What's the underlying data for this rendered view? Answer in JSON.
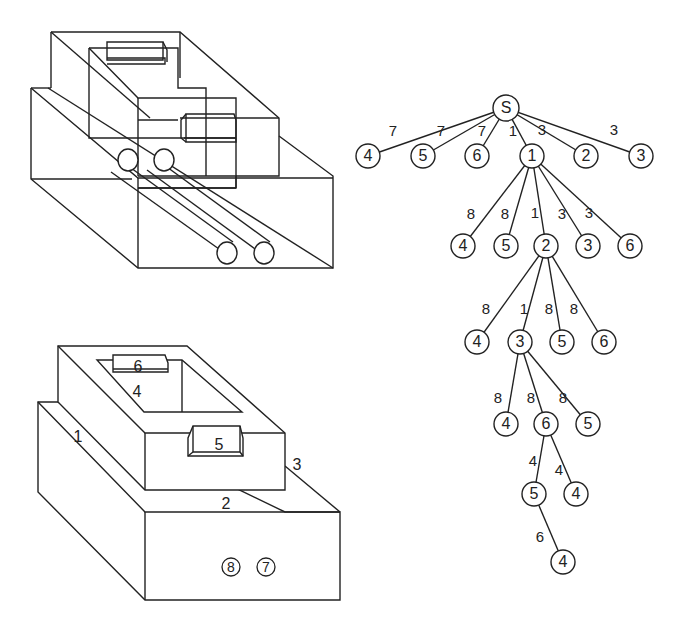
{
  "figure": {
    "top_drawing": {
      "description": "3D wireframe of stepped block assembly with two cylindrical pipes"
    },
    "bottom_drawing": {
      "labels": [
        {
          "text": "6",
          "x": 138,
          "y": 368
        },
        {
          "text": "4",
          "x": 137,
          "y": 393
        },
        {
          "text": "1",
          "x": 78,
          "y": 438
        },
        {
          "text": "5",
          "x": 219,
          "y": 446
        },
        {
          "text": "3",
          "x": 297,
          "y": 466
        },
        {
          "text": "2",
          "x": 226,
          "y": 505
        }
      ],
      "circled_labels": [
        {
          "text": "8",
          "x": 231,
          "y": 567
        },
        {
          "text": "7",
          "x": 266,
          "y": 567
        }
      ]
    },
    "tree": {
      "nodes": [
        {
          "id": "S",
          "label": "S",
          "x": 506,
          "y": 108
        },
        {
          "id": "a4",
          "label": "4",
          "x": 368,
          "y": 156
        },
        {
          "id": "a5",
          "label": "5",
          "x": 423,
          "y": 156
        },
        {
          "id": "a6",
          "label": "6",
          "x": 477,
          "y": 156
        },
        {
          "id": "a1",
          "label": "1",
          "x": 532,
          "y": 156
        },
        {
          "id": "a2",
          "label": "2",
          "x": 586,
          "y": 156
        },
        {
          "id": "a3",
          "label": "3",
          "x": 641,
          "y": 156
        },
        {
          "id": "b4",
          "label": "4",
          "x": 463,
          "y": 246
        },
        {
          "id": "b5",
          "label": "5",
          "x": 506,
          "y": 246
        },
        {
          "id": "b2",
          "label": "2",
          "x": 546,
          "y": 246
        },
        {
          "id": "b3",
          "label": "3",
          "x": 588,
          "y": 246
        },
        {
          "id": "b6",
          "label": "6",
          "x": 630,
          "y": 246
        },
        {
          "id": "c4",
          "label": "4",
          "x": 477,
          "y": 342
        },
        {
          "id": "c3",
          "label": "3",
          "x": 520,
          "y": 342
        },
        {
          "id": "c5",
          "label": "5",
          "x": 562,
          "y": 342
        },
        {
          "id": "c6",
          "label": "6",
          "x": 604,
          "y": 342
        },
        {
          "id": "d4",
          "label": "4",
          "x": 506,
          "y": 424
        },
        {
          "id": "d6",
          "label": "6",
          "x": 546,
          "y": 424
        },
        {
          "id": "d5",
          "label": "5",
          "x": 588,
          "y": 424
        },
        {
          "id": "e5",
          "label": "5",
          "x": 534,
          "y": 494
        },
        {
          "id": "e4",
          "label": "4",
          "x": 576,
          "y": 494
        },
        {
          "id": "f4",
          "label": "4",
          "x": 563,
          "y": 562
        }
      ],
      "edges": [
        {
          "from": "S",
          "to": "a4",
          "weight": "7",
          "lx": 393,
          "ly": 132
        },
        {
          "from": "S",
          "to": "a5",
          "weight": "7",
          "lx": 441,
          "ly": 132
        },
        {
          "from": "S",
          "to": "a6",
          "weight": "7",
          "lx": 482,
          "ly": 132
        },
        {
          "from": "S",
          "to": "a1",
          "weight": "1",
          "lx": 513,
          "ly": 132
        },
        {
          "from": "S",
          "to": "a2",
          "weight": "3",
          "lx": 542,
          "ly": 131
        },
        {
          "from": "S",
          "to": "a3",
          "weight": "3",
          "lx": 614,
          "ly": 131
        },
        {
          "from": "a1",
          "to": "b4",
          "weight": "8",
          "lx": 471,
          "ly": 215
        },
        {
          "from": "a1",
          "to": "b5",
          "weight": "8",
          "lx": 505,
          "ly": 215
        },
        {
          "from": "a1",
          "to": "b2",
          "weight": "1",
          "lx": 535,
          "ly": 214
        },
        {
          "from": "a1",
          "to": "b3",
          "weight": "3",
          "lx": 562,
          "ly": 215
        },
        {
          "from": "a1",
          "to": "b6",
          "weight": "3",
          "lx": 589,
          "ly": 214
        },
        {
          "from": "b2",
          "to": "c4",
          "weight": "8",
          "lx": 486,
          "ly": 310
        },
        {
          "from": "b2",
          "to": "c3",
          "weight": "1",
          "lx": 524,
          "ly": 310
        },
        {
          "from": "b2",
          "to": "c5",
          "weight": "8",
          "lx": 549,
          "ly": 310
        },
        {
          "from": "b2",
          "to": "c6",
          "weight": "8",
          "lx": 574,
          "ly": 310
        },
        {
          "from": "c3",
          "to": "d4",
          "weight": "8",
          "lx": 498,
          "ly": 399
        },
        {
          "from": "c3",
          "to": "d6",
          "weight": "8",
          "lx": 531,
          "ly": 399
        },
        {
          "from": "c3",
          "to": "d5",
          "weight": "8",
          "lx": 563,
          "ly": 399
        },
        {
          "from": "d6",
          "to": "e5",
          "weight": "4",
          "lx": 533,
          "ly": 462
        },
        {
          "from": "d6",
          "to": "e4",
          "weight": "4",
          "lx": 559,
          "ly": 471
        },
        {
          "from": "e5",
          "to": "f4",
          "weight": "6",
          "lx": 540,
          "ly": 538
        }
      ]
    }
  }
}
